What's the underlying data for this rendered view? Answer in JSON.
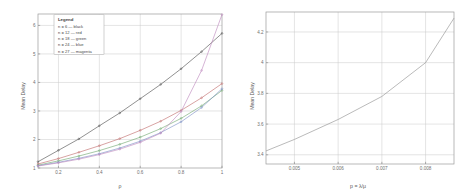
{
  "figure": {
    "background": "#ffffff",
    "axis_color": "#9a9a9a",
    "grid_color": "#c9c9c9"
  },
  "chart_data": [
    {
      "id": "left",
      "type": "line",
      "title": "",
      "xlabel": "ρ",
      "ylabel": "Mean Delay",
      "xlim": [
        0.1,
        1.0
      ],
      "ylim": [
        1.0,
        6.4
      ],
      "xticks": [
        0.2,
        0.4,
        0.6,
        0.8,
        1
      ],
      "xticklabels": [
        "0.2",
        "0.4",
        "0.6",
        "0.8",
        "1"
      ],
      "yticks": [
        1,
        2,
        3,
        4,
        5,
        6
      ],
      "yticklabels": [
        "1",
        "2",
        "3",
        "4",
        "5",
        "6"
      ],
      "grid": true,
      "legend": {
        "position": "upper-left-inset",
        "title": "Legend",
        "entries": [
          {
            "label": "n = 6 — black",
            "series": "n = 6",
            "color": "#4d4d4d"
          },
          {
            "label": "n = 12 — red",
            "series": "n = 12",
            "color": "#c06a6a"
          },
          {
            "label": "n = 18 — green",
            "series": "n = 18",
            "color": "#6fa86f"
          },
          {
            "label": "n = 24 — blue",
            "series": "n = 24",
            "color": "#7b8fc4"
          },
          {
            "label": "n = 27 — magenta",
            "series": "n = 27",
            "color": "#bd86bd"
          }
        ]
      },
      "x": [
        0.1,
        0.2,
        0.3,
        0.4,
        0.5,
        0.6,
        0.7,
        0.8,
        0.9,
        1.0
      ],
      "series": [
        {
          "name": "n = 6",
          "color": "#4d4d4d",
          "marker": "point",
          "values": [
            1.22,
            1.62,
            2.02,
            2.48,
            2.93,
            3.43,
            3.93,
            4.48,
            5.08,
            5.72
          ]
        },
        {
          "name": "n = 12",
          "color": "#c06a6a",
          "marker": "point",
          "values": [
            1.14,
            1.33,
            1.55,
            1.78,
            2.03,
            2.32,
            2.64,
            3.02,
            3.46,
            3.96
          ]
        },
        {
          "name": "n = 18",
          "color": "#6fa86f",
          "marker": "point",
          "values": [
            1.1,
            1.25,
            1.42,
            1.61,
            1.83,
            2.08,
            2.38,
            2.74,
            3.18,
            3.72
          ]
        },
        {
          "name": "n = 24",
          "color": "#7b8fc4",
          "marker": "point",
          "values": [
            1.08,
            1.2,
            1.34,
            1.5,
            1.7,
            1.94,
            2.24,
            2.62,
            3.12,
            3.78
          ]
        },
        {
          "name": "n = 27",
          "color": "#bd86bd",
          "marker": "point",
          "values": [
            1.07,
            1.18,
            1.31,
            1.47,
            1.66,
            1.9,
            2.22,
            2.98,
            4.42,
            6.38
          ]
        }
      ]
    },
    {
      "id": "right",
      "type": "line",
      "title": "",
      "xlabel": "p = λ/μ",
      "ylabel": "Mean Delay",
      "xlim": [
        0.00435,
        0.00865
      ],
      "ylim": [
        3.34,
        4.33
      ],
      "xticks": [
        0.005,
        0.006,
        0.007,
        0.008
      ],
      "xticklabels": [
        "0.005",
        "0.006",
        "0.007",
        "0.008"
      ],
      "yticks": [
        3.4,
        3.6,
        3.8,
        4,
        4.2
      ],
      "yticklabels": [
        "3.4",
        "3.6",
        "3.8",
        "4",
        "4.2"
      ],
      "grid": true,
      "legend": null,
      "series": [
        {
          "name": "mean-delay",
          "color": "#8f8f8f",
          "marker": "none",
          "x": [
            0.00435,
            0.005,
            0.006,
            0.007,
            0.008,
            0.00865
          ],
          "values": [
            3.425,
            3.5,
            3.63,
            3.78,
            4.0,
            4.29
          ]
        }
      ]
    }
  ]
}
